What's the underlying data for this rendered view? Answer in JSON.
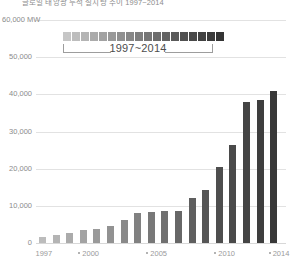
{
  "chart_data": {
    "type": "bar",
    "title": "글로벌 태양광 누적 설치량 추이 1997~2014",
    "unit_label": "60,000 MW",
    "xlabel": "",
    "ylabel": "MW",
    "ylim": [
      0,
      60000
    ],
    "grid": true,
    "categories": [
      "1997",
      "1998",
      "1999",
      "2000",
      "2001",
      "2002",
      "2003",
      "2004",
      "2005",
      "2006",
      "2007",
      "2008",
      "2009",
      "2010",
      "2011",
      "2012",
      "2013",
      "2014"
    ],
    "values": [
      1700,
      2100,
      2600,
      3400,
      3900,
      4600,
      6200,
      8200,
      8400,
      8700,
      8700,
      12000,
      14200,
      20400,
      26300,
      38000,
      38400,
      41000
    ],
    "series": [
      {
        "name": "Installed capacity (MW)",
        "values": [
          1700,
          2100,
          2600,
          3400,
          3900,
          4600,
          6200,
          8200,
          8400,
          8700,
          8700,
          12000,
          14200,
          20400,
          26300,
          38000,
          38400,
          41000
        ]
      }
    ],
    "ytick_labels": [
      "0",
      "10,000",
      "20,000",
      "30,000",
      "40,000",
      "50,000"
    ],
    "ytick_values": [
      0,
      10000,
      20000,
      30000,
      40000,
      50000
    ],
    "xtick_labels": [
      "1997",
      "2000",
      "2005",
      "2010",
      "2014"
    ],
    "xtick_indices": [
      0,
      3,
      8,
      13,
      17
    ],
    "bar_color_start": "#bcbcbc",
    "bar_color_end": "#383838",
    "grid_color": "#e2e2e2",
    "axis_color": "#d8d8d8",
    "text_color": "#8b8b8b"
  },
  "bars": [
    {
      "year": "1997",
      "value": 1700,
      "color": "#bcbcbc"
    },
    {
      "year": "1998",
      "value": 2100,
      "color": "#b4b4b4"
    },
    {
      "year": "1999",
      "value": 2600,
      "color": "#ababab"
    },
    {
      "year": "2000",
      "value": 3400,
      "color": "#a3a3a3"
    },
    {
      "year": "2001",
      "value": 3900,
      "color": "#9a9a9a"
    },
    {
      "year": "2002",
      "value": 4600,
      "color": "#929292"
    },
    {
      "year": "2003",
      "value": 6200,
      "color": "#898989"
    },
    {
      "year": "2004",
      "value": 8200,
      "color": "#818181"
    },
    {
      "year": "2005",
      "value": 8400,
      "color": "#787878"
    },
    {
      "year": "2006",
      "value": 8700,
      "color": "#707070"
    },
    {
      "year": "2007",
      "value": 8700,
      "color": "#676767"
    },
    {
      "year": "2008",
      "value": 12000,
      "color": "#5f5f5f"
    },
    {
      "year": "2009",
      "value": 14200,
      "color": "#565656"
    },
    {
      "year": "2010",
      "value": 20400,
      "color": "#4e4e4e"
    },
    {
      "year": "2011",
      "value": 26300,
      "color": "#4a4a4a"
    },
    {
      "year": "2012",
      "value": 38000,
      "color": "#444444"
    },
    {
      "year": "2013",
      "value": 38400,
      "color": "#3e3e3e"
    },
    {
      "year": "2014",
      "value": 41000,
      "color": "#383838"
    }
  ],
  "legend": {
    "label": "1997~2014",
    "swatches": [
      "#c6c6c6",
      "#bdbdbd",
      "#b4b4b4",
      "#ababab",
      "#a2a2a2",
      "#999999",
      "#909090",
      "#878787",
      "#7e7e7e",
      "#757575",
      "#6c6c6c",
      "#636363",
      "#5a5a5a",
      "#515151",
      "#494949",
      "#424242",
      "#3b3b3b",
      "#343434"
    ]
  },
  "axes": {
    "top_label": "60,000 MW",
    "y_labels": [
      "50,000",
      "40,000",
      "30,000",
      "20,000",
      "10,000",
      "0"
    ],
    "x_labels": [
      "1997",
      "2000",
      "2005",
      "2010",
      "2014"
    ]
  }
}
